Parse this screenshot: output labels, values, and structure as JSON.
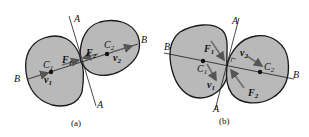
{
  "colors": {
    "body_fill": "#b9b9b9",
    "stroke": "#1a1a1a",
    "arrow": "#6e6e6e",
    "background": "#ffffff"
  },
  "panels": [
    {
      "caption": "(a)",
      "labels": {
        "A_top": "A",
        "A_bottom": "A",
        "B_left": "B",
        "B_right": "B",
        "C1": "C",
        "C1_sub": "1",
        "C2": "C",
        "C2_sub": "2",
        "F1": "F",
        "F1_sub": "1",
        "F2": "F",
        "F2_sub": "2",
        "v1": "v",
        "v1_sub": "1",
        "v2": "v",
        "v2_sub": "2"
      }
    },
    {
      "caption": "(b)",
      "labels": {
        "A_top": "A",
        "A_bottom": "A",
        "B_left": "B",
        "B_right": "B",
        "C1": "C",
        "C1_sub": "1",
        "C2": "C",
        "C2_sub": "2",
        "F1": "F",
        "F1_sub": "1",
        "F2": "F",
        "F2_sub": "2",
        "v1": "v",
        "v1_sub": "1",
        "v2": "v",
        "v2_sub": "2"
      }
    }
  ]
}
